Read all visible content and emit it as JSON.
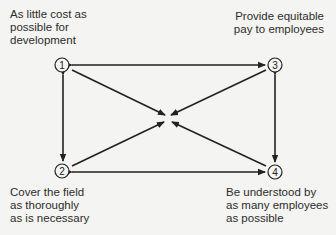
{
  "diagram": {
    "type": "goal-tradeoff-diagram",
    "nodes": [
      {
        "id": "1",
        "number": "1",
        "label_lines": [
          "As little cost as",
          "possible for",
          "development"
        ]
      },
      {
        "id": "2",
        "number": "2",
        "label_lines": [
          "Cover the field",
          "as thoroughly",
          "as is necessary"
        ]
      },
      {
        "id": "3",
        "number": "3",
        "label_lines": [
          "Provide equitable",
          "pay to employees"
        ]
      },
      {
        "id": "4",
        "number": "4",
        "label_lines": [
          "Be understood by",
          "as many employees",
          "as possible"
        ]
      }
    ],
    "edges": [
      {
        "from": "1",
        "to": "3",
        "style": "double-arrow"
      },
      {
        "from": "1",
        "to": "2",
        "style": "double-arrow"
      },
      {
        "from": "3",
        "to": "4",
        "style": "double-arrow"
      },
      {
        "from": "2",
        "to": "4",
        "style": "double-arrow"
      },
      {
        "from": "1",
        "to": "center",
        "style": "arrow"
      },
      {
        "from": "2",
        "to": "center",
        "style": "arrow"
      },
      {
        "from": "3",
        "to": "center",
        "style": "arrow"
      },
      {
        "from": "4",
        "to": "center",
        "style": "arrow"
      }
    ],
    "colors": {
      "background": "#f4f4f2",
      "ink": "#222222"
    }
  }
}
